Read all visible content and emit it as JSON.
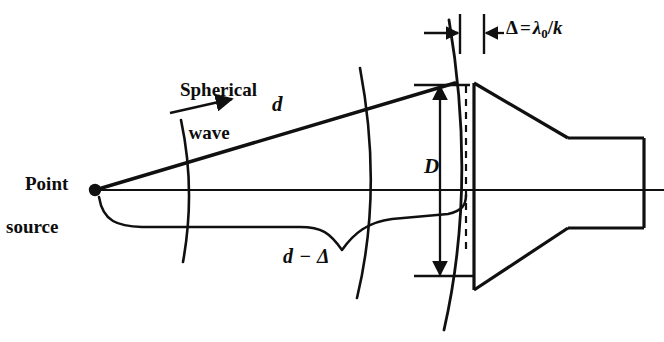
{
  "figure": {
    "type": "optical-antenna-diagram",
    "background_color": "#ffffff",
    "stroke_color": "#101010",
    "labels": {
      "spherical_wave_line1": "Spherical",
      "spherical_wave_line2": "wave",
      "point_source_line1": "Point",
      "point_source_line2": "source",
      "ray_distance": "d",
      "axis_distance": "d − Δ",
      "aperture_diameter": "D",
      "delta_symbol": "Δ",
      "delta_equals": "=",
      "delta_lambda": "λ",
      "delta_lambda_subscript": "0",
      "delta_slash": "/",
      "delta_k": "k"
    }
  },
  "geometry": {
    "point_source": {
      "x": 95,
      "y": 190,
      "dot_radius": 6
    },
    "axis_line": {
      "x1": 95,
      "y1": 190,
      "x2": 664,
      "y2": 190
    },
    "ray_line": {
      "x1": 95,
      "y1": 190,
      "x2": 452,
      "y2": 84
    },
    "wavefront_arcs": [
      {
        "name": "arc-1",
        "cx": 95,
        "cy": 190,
        "r": 95
      },
      {
        "name": "arc-2",
        "cx": 95,
        "cy": 190,
        "r": 282
      },
      {
        "name": "arc-3",
        "cx": 95,
        "cy": 190,
        "r": 372
      }
    ],
    "horn": {
      "aperture_x": 474,
      "aperture_top_y": 83,
      "aperture_bottom_y": 290,
      "throat_x": 568,
      "throat_top_y": 138,
      "throat_bottom_y": 228,
      "guide_right_x": 644
    },
    "dimension_D": {
      "x": 440,
      "top_y": 85,
      "bottom_y": 276
    },
    "dimension_delta": {
      "left_tick_x": 460,
      "right_tick_x": 484,
      "y": 33
    },
    "dashed_line": {
      "x": 466,
      "y1": 86,
      "y2": 250
    }
  }
}
